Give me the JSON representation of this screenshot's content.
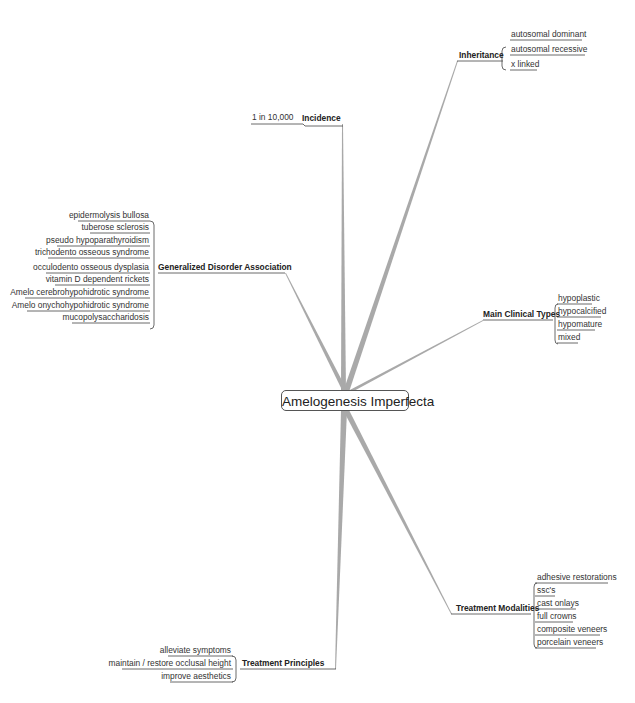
{
  "central": {
    "label": "Amelogenesis Imperfecta"
  },
  "topics": {
    "inheritance": {
      "label": "Inheritance",
      "items": [
        "autosomal dominant",
        "autosomal recessive",
        "x linked"
      ]
    },
    "incidence": {
      "label": "Incidence",
      "items": [
        "1 in 10,000"
      ]
    },
    "generalized": {
      "label": "Generalized Disorder Association",
      "items": [
        "epidermolysis bullosa",
        "tuberose sclerosis",
        "pseudo hypoparathyroidism",
        "trichodento osseous syndrome",
        "occulodento osseous dysplasia",
        "vitamin D dependent rickets",
        "Amelo cerebrohypohidrotic syndrome",
        "Amelo onychohypohidrotic syndrome",
        "mucopolysaccharidosis"
      ]
    },
    "clinical": {
      "label": "Main Clinical Types",
      "items": [
        "hypoplastic",
        "hypocalcified",
        "hypomature",
        "mixed"
      ]
    },
    "modalities": {
      "label": "Treatment Modalities",
      "items": [
        "adhesive restorations",
        "ssc's",
        "cast onlays",
        "full crowns",
        "composite veneers",
        "porcelain veneers"
      ]
    },
    "principles": {
      "label": "Treatment Principles",
      "items": [
        "alleviate symptoms",
        "maintain / restore occlusal height",
        "improve aesthetics"
      ]
    }
  },
  "colors": {
    "branch": "#a8a8a8",
    "underline": "#444444",
    "text": "#222222"
  }
}
